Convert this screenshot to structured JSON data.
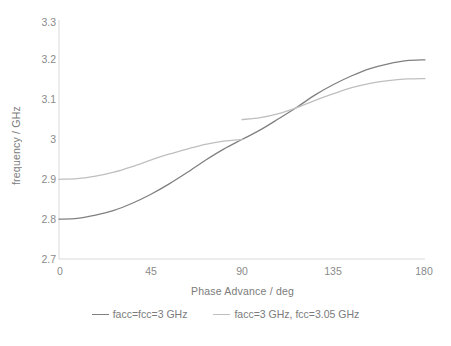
{
  "chart_data": {
    "type": "line",
    "title": "",
    "xlabel": "Phase Advance / deg",
    "ylabel": "frequency / GHz",
    "xlim": [
      0,
      180
    ],
    "ylim": [
      2.7,
      3.3
    ],
    "xticks": [
      "0",
      "45",
      "90",
      "135",
      "180"
    ],
    "xtick_values": [
      0,
      45,
      90,
      135,
      180
    ],
    "yticks": [
      "3.3",
      "3.2",
      "3.1",
      "3",
      "2.9",
      "2.8",
      "2.7"
    ],
    "ytick_values": [
      3.3,
      3.2,
      3.1,
      3.0,
      2.9,
      2.8,
      2.7
    ],
    "grid": false,
    "legend_position": "bottom",
    "series": [
      {
        "name": "facc=fcc=3 GHz",
        "color": "#808080",
        "x": [
          0,
          9,
          18,
          27,
          36,
          45,
          54,
          63,
          72,
          81,
          90,
          99,
          108,
          117,
          126,
          135,
          144,
          153,
          162,
          171,
          180
        ],
        "values": [
          2.8,
          2.802,
          2.81,
          2.822,
          2.84,
          2.862,
          2.888,
          2.917,
          2.948,
          2.976,
          3.0,
          3.024,
          3.052,
          3.081,
          3.112,
          3.138,
          3.16,
          3.178,
          3.19,
          3.198,
          3.2
        ]
      },
      {
        "name": "facc=3 GHz, fcc=3.05 GHz",
        "color": "#bfbfbf",
        "x": [
          0,
          9,
          18,
          27,
          36,
          45,
          54,
          63,
          72,
          81,
          90,
          90,
          99,
          108,
          117,
          126,
          135,
          144,
          153,
          162,
          171,
          180
        ],
        "values": [
          2.9,
          2.902,
          2.908,
          2.918,
          2.932,
          2.948,
          2.963,
          2.976,
          2.988,
          2.996,
          3.0,
          3.05,
          3.055,
          3.065,
          3.08,
          3.098,
          3.115,
          3.13,
          3.141,
          3.148,
          3.152,
          3.153
        ],
        "discontinuity_at": 90,
        "band_edge_lower": 3.0,
        "band_edge_upper": 3.05
      }
    ]
  },
  "legend": {
    "items": [
      {
        "label": "facc=fcc=3 GHz",
        "color": "#808080"
      },
      {
        "label": "facc=3 GHz, fcc=3.05 GHz",
        "color": "#bfbfbf"
      }
    ]
  },
  "axes": {
    "y_title": "frequency / GHz",
    "x_title": "Phase Advance / deg",
    "y_tick_labels": [
      "3.3",
      "3.2",
      "3.1",
      "3",
      "2.9",
      "2.8",
      "2.7"
    ],
    "x_tick_labels": [
      "0",
      "45",
      "90",
      "135",
      "180"
    ]
  }
}
